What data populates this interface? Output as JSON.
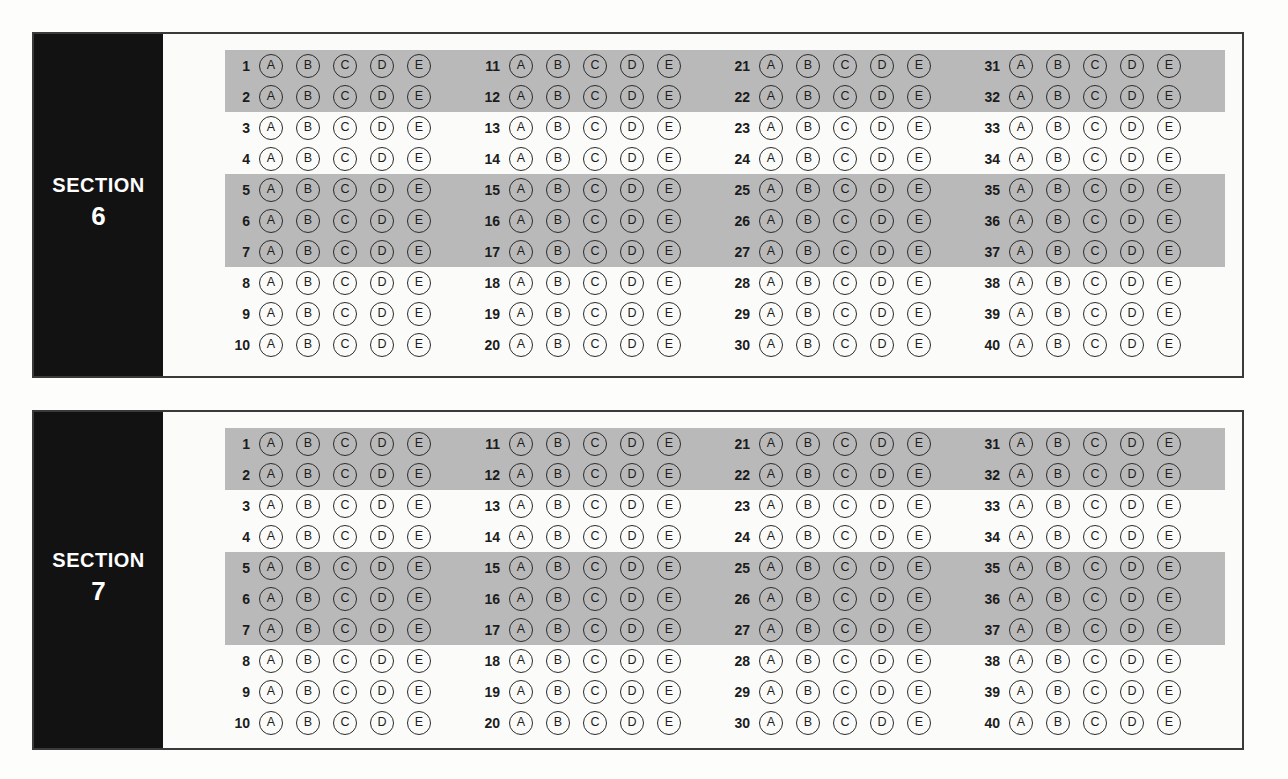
{
  "document": {
    "type": "standardized-test-answer-sheet",
    "background_color": "#fdfdfc",
    "panel_border_color": "#3a3a3a",
    "label_block_color": "#121212",
    "shaded_row_color": "#b9b9b9"
  },
  "choices": [
    "A",
    "B",
    "C",
    "D",
    "E"
  ],
  "shaded_rows_in_group": [
    1,
    2,
    5,
    6,
    7
  ],
  "sections": [
    {
      "label_word": "SECTION",
      "label_number": "6",
      "groups": [
        {
          "numbers": [
            "1",
            "2",
            "3",
            "4",
            "5",
            "6",
            "7",
            "8",
            "9",
            "10"
          ]
        },
        {
          "numbers": [
            "11",
            "12",
            "13",
            "14",
            "15",
            "16",
            "17",
            "18",
            "19",
            "20"
          ]
        },
        {
          "numbers": [
            "21",
            "22",
            "23",
            "24",
            "25",
            "26",
            "27",
            "28",
            "29",
            "30"
          ]
        },
        {
          "numbers": [
            "31",
            "32",
            "33",
            "34",
            "35",
            "36",
            "37",
            "38",
            "39",
            "40"
          ]
        }
      ]
    },
    {
      "label_word": "SECTION",
      "label_number": "7",
      "groups": [
        {
          "numbers": [
            "1",
            "2",
            "3",
            "4",
            "5",
            "6",
            "7",
            "8",
            "9",
            "10"
          ]
        },
        {
          "numbers": [
            "11",
            "12",
            "13",
            "14",
            "15",
            "16",
            "17",
            "18",
            "19",
            "20"
          ]
        },
        {
          "numbers": [
            "21",
            "22",
            "23",
            "24",
            "25",
            "26",
            "27",
            "28",
            "29",
            "30"
          ]
        },
        {
          "numbers": [
            "31",
            "32",
            "33",
            "34",
            "35",
            "36",
            "37",
            "38",
            "39",
            "40"
          ]
        }
      ]
    }
  ]
}
